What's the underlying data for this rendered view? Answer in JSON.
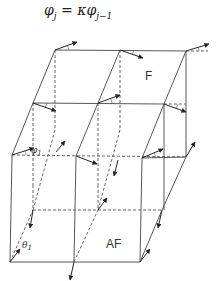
{
  "formula": {
    "lhs": "φ",
    "lhs_sub": "j",
    "eq": " = κφ",
    "rhs_sub": "j−1"
  },
  "labels": {
    "upper_layer": "F",
    "lower_layer": "AF",
    "phi_angle": "φ",
    "phi_sub": "1",
    "theta_angle": "θ",
    "theta_sub": "1"
  },
  "colors": {
    "lines": "#444444",
    "vectors": "#222222",
    "background": "#ffffff"
  }
}
